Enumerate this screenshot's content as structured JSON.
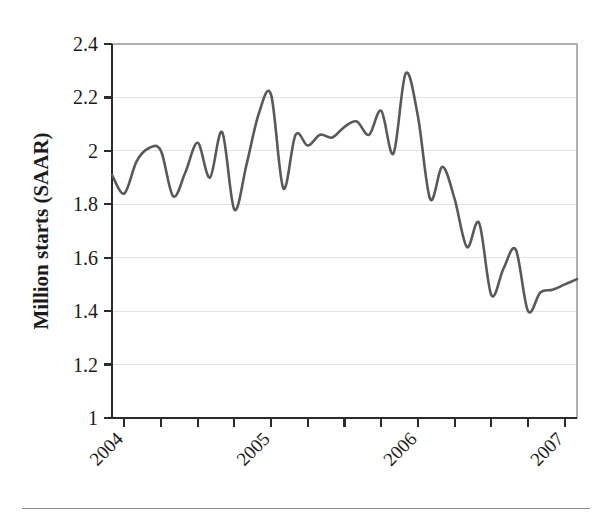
{
  "chart_data": {
    "type": "line",
    "title": "",
    "subtitle": "",
    "xlabel": "",
    "ylabel": "Million starts (SAAR)",
    "series_name": "Housing starts",
    "line_color": "#595959",
    "grid": true,
    "grid_axis": "y",
    "legend": "none",
    "xlim": [
      "2003-12",
      "2007-02"
    ],
    "ylim": [
      1,
      2.4
    ],
    "ytick_labels": [
      "2.4",
      "2.2",
      "2",
      "1.8",
      "1.6",
      "1.4",
      "1.2",
      "1"
    ],
    "ytick_values": [
      2.4,
      2.2,
      2.0,
      1.8,
      1.6,
      1.4,
      1.2,
      1.0
    ],
    "xtick_labels": [
      "2004",
      "2005",
      "2006",
      "2007"
    ],
    "xtick_values": [
      "2004-01",
      "2005-01",
      "2006-01",
      "2007-01"
    ],
    "xtick_rotation": 45,
    "minor_xticks_per_year": 4,
    "x": [
      "2003-12",
      "2004-01",
      "2004-02",
      "2004-03",
      "2004-04",
      "2004-05",
      "2004-06",
      "2004-07",
      "2004-08",
      "2004-09",
      "2004-10",
      "2004-11",
      "2004-12",
      "2005-01",
      "2005-02",
      "2005-03",
      "2005-04",
      "2005-05",
      "2005-06",
      "2005-07",
      "2005-08",
      "2005-09",
      "2005-10",
      "2005-11",
      "2005-12",
      "2006-01",
      "2006-02",
      "2006-03",
      "2006-04",
      "2006-05",
      "2006-06",
      "2006-07",
      "2006-08",
      "2006-09",
      "2006-10",
      "2006-11",
      "2006-12",
      "2007-01",
      "2007-02"
    ],
    "values": [
      1.91,
      1.84,
      1.96,
      2.01,
      2.0,
      1.83,
      1.92,
      2.03,
      1.9,
      2.07,
      1.78,
      1.95,
      2.14,
      2.21,
      1.86,
      2.06,
      2.02,
      2.06,
      2.05,
      2.09,
      2.11,
      2.06,
      2.15,
      1.99,
      2.29,
      2.13,
      1.82,
      1.94,
      1.82,
      1.64,
      1.73,
      1.46,
      1.56,
      1.63,
      1.4,
      1.47,
      1.48,
      1.5,
      1.52
    ]
  },
  "figure": {
    "width": 606,
    "height": 518,
    "background": "#ffffff",
    "footer_rule_color": "#8a8a8a"
  },
  "plot_area": {
    "left": 112,
    "top": 44,
    "right": 577,
    "bottom": 418
  }
}
